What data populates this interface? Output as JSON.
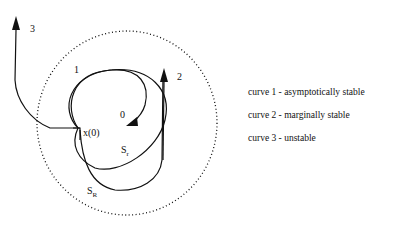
{
  "diagram": {
    "labels": {
      "curve1": "1",
      "curve2": "2",
      "curve3": "3",
      "origin": "0",
      "initial_state": "x(0)",
      "small_region": "S",
      "small_region_sub": "r",
      "large_region": "S",
      "large_region_sub": "R"
    },
    "legend": [
      {
        "text": "curve 1  -  asymptotically stable"
      },
      {
        "text": "curve 2  -  marginally stable"
      },
      {
        "text": "curve 3  -  unstable"
      }
    ]
  }
}
